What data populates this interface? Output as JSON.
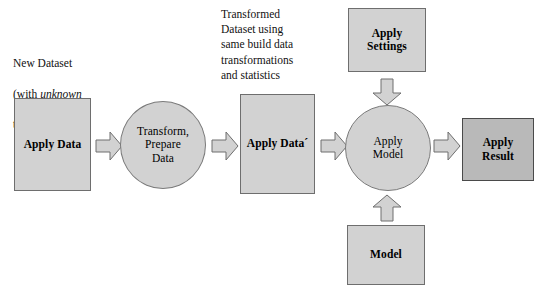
{
  "diagram": {
    "background_color": "#ffffff",
    "node_fill": "#d2d2d2",
    "result_fill": "#b9b9b9",
    "arrow_fill": "#d2d2d2",
    "stroke_color": "#6e6e6e"
  },
  "captions": {
    "new_dataset": {
      "line1": "New Dataset",
      "line2_pre": "(with ",
      "line2_em": "unknown",
      "line2_post": "",
      "line3": "target values)"
    },
    "transformed_dataset": {
      "text": "Transformed\nDataset using\nsame build data\ntransformations\nand statistics"
    }
  },
  "nodes": {
    "apply_data": {
      "label": "Apply Data",
      "shape": "rectangle",
      "bold": true
    },
    "transform_prepare": {
      "label": "Transform,\nPrepare\nData",
      "shape": "ellipse",
      "bold": false
    },
    "apply_data_prime": {
      "label": "Apply Data´",
      "shape": "rectangle",
      "bold": true
    },
    "apply_settings": {
      "label": "Apply\nSettings",
      "shape": "rectangle",
      "bold": true
    },
    "apply_model": {
      "label": "Apply\nModel",
      "shape": "ellipse",
      "bold": false
    },
    "model": {
      "label": "Model",
      "shape": "rectangle",
      "bold": true
    },
    "apply_result": {
      "label": "Apply\nResult",
      "shape": "rectangle",
      "bold": true
    }
  },
  "arrows": [
    {
      "name": "arrow-apply-data-to-transform",
      "direction": "right"
    },
    {
      "name": "arrow-transform-to-apply-data-prime",
      "direction": "right"
    },
    {
      "name": "arrow-apply-data-prime-to-apply-model",
      "direction": "right"
    },
    {
      "name": "arrow-apply-model-to-apply-result",
      "direction": "right"
    },
    {
      "name": "arrow-apply-settings-to-apply-model",
      "direction": "down"
    },
    {
      "name": "arrow-model-to-apply-model",
      "direction": "up"
    }
  ]
}
